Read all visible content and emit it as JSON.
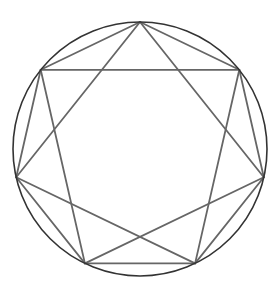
{
  "figure": {
    "background_color": "#ffffff",
    "canvas": {
      "width": 274,
      "height": 296
    }
  },
  "chart_data": {
    "type": "diagram",
    "subtitle": "",
    "xlabel": "",
    "ylabel": "",
    "grid": false,
    "legend": false,
    "axis_visible": false,
    "coordinate_space": {
      "width": 274,
      "height": 296,
      "origin": "top-left",
      "y_axis": "down"
    },
    "circle": {
      "name": "circumscribed-circle",
      "center_x": 140,
      "center_y": 149,
      "radius": 127,
      "stroke": "#333333",
      "stroke_width": 1.6,
      "fill": "none"
    },
    "polygon": {
      "name": "regular-heptagon",
      "sides": 7,
      "start_angle_deg": -90,
      "interior_angle_deg": 128.57,
      "central_angle_deg": 51.43,
      "stroke": "#666666",
      "stroke_width": 1.8,
      "fill": "none"
    },
    "star": {
      "name": "star-polygon-7-2",
      "schlafli": "{7/2}",
      "step": 2,
      "stroke": "#666666",
      "stroke_width": 1.8,
      "fill": "none"
    },
    "vertices": [
      {
        "index": 0,
        "label": "top",
        "angle_deg": -90.0,
        "x": 140.0,
        "y": 22.0
      },
      {
        "index": 1,
        "label": "upper-right",
        "angle_deg": -38.57,
        "x": 239.3,
        "y": 69.8
      },
      {
        "index": 2,
        "label": "right",
        "angle_deg": 12.86,
        "x": 263.8,
        "y": 177.3
      },
      {
        "index": 3,
        "label": "lower-right",
        "angle_deg": 64.29,
        "x": 195.1,
        "y": 263.4
      },
      {
        "index": 4,
        "label": "lower-left",
        "angle_deg": 115.71,
        "x": 84.9,
        "y": 263.4
      },
      {
        "index": 5,
        "label": "left",
        "angle_deg": 167.14,
        "x": 16.2,
        "y": 177.3
      },
      {
        "index": 6,
        "label": "upper-left",
        "angle_deg": -141.43,
        "x": 40.7,
        "y": 69.8
      }
    ],
    "polygon_edges": [
      {
        "from": 0,
        "to": 1
      },
      {
        "from": 1,
        "to": 2
      },
      {
        "from": 2,
        "to": 3
      },
      {
        "from": 3,
        "to": 4
      },
      {
        "from": 4,
        "to": 5
      },
      {
        "from": 5,
        "to": 6
      },
      {
        "from": 6,
        "to": 0
      }
    ],
    "star_chords": [
      {
        "from": 0,
        "to": 2
      },
      {
        "from": 2,
        "to": 4
      },
      {
        "from": 4,
        "to": 6
      },
      {
        "from": 6,
        "to": 1
      },
      {
        "from": 1,
        "to": 3
      },
      {
        "from": 3,
        "to": 5
      },
      {
        "from": 5,
        "to": 0
      }
    ],
    "annotations": []
  }
}
